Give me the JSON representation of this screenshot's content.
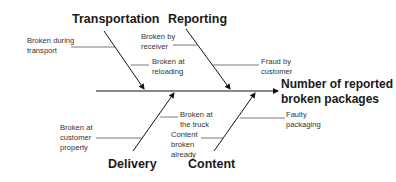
{
  "diagram": {
    "type": "fishbone",
    "effect": {
      "line1": "Number of reported",
      "line2": "broken packages"
    },
    "categories": [
      {
        "name": "Transportation",
        "position": "top-left",
        "causes": [
          {
            "line1": "Broken during",
            "line2": "transport"
          },
          {
            "line1": "Broken at",
            "line2": "reloading"
          }
        ]
      },
      {
        "name": "Reporting",
        "position": "top-right",
        "causes": [
          {
            "line1": "Broken by",
            "line2": "receiver"
          },
          {
            "line1": "Fraud by",
            "line2": "customer"
          }
        ]
      },
      {
        "name": "Delivery",
        "position": "bottom-left",
        "causes": [
          {
            "line1": "Broken at",
            "line2": "customer",
            "line3": "property"
          }
        ]
      },
      {
        "name": "Content",
        "position": "bottom-right",
        "causes": [
          {
            "line1": "Broken at",
            "line2": "the truck"
          },
          {
            "line1": "Content",
            "line2": "broken",
            "line3": "already"
          }
        ]
      }
    ]
  }
}
